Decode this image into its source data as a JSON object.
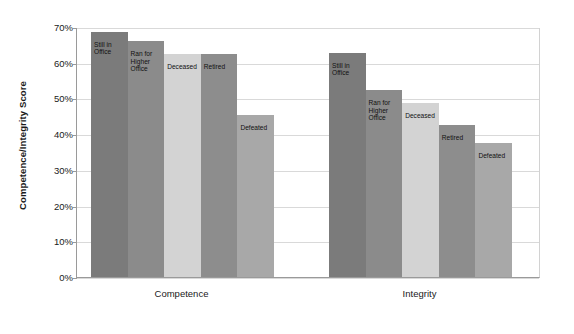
{
  "chart_data": {
    "type": "bar",
    "title": "",
    "xlabel": "",
    "ylabel": "Competence/Integrity Score",
    "ylim": [
      0,
      70
    ],
    "ytick_labels": [
      "0%",
      "10%",
      "20%",
      "30%",
      "40%",
      "50%",
      "60%",
      "70%"
    ],
    "ytick_values": [
      0,
      10,
      20,
      30,
      40,
      50,
      60,
      70
    ],
    "grid": true,
    "legend": "none",
    "categories": [
      "Still in Office",
      "Ran for Higher Office",
      "Deceased",
      "Retired",
      "Defeated"
    ],
    "groups": [
      "Competence",
      "Integrity"
    ],
    "series": [
      {
        "name": "Competence",
        "values": [
          68.7,
          66.0,
          62.5,
          62.4,
          45.3
        ]
      },
      {
        "name": "Integrity",
        "values": [
          62.8,
          52.3,
          48.8,
          42.5,
          37.5
        ]
      }
    ],
    "bar_colors": [
      "#7b7b7b",
      "#8b8b8b",
      "#d3d3d3",
      "#8d8d8d",
      "#a8a8a8"
    ],
    "bar_label_texts": [
      [
        "Still in",
        "Office"
      ],
      [
        "Ran for",
        "Higher",
        "Office"
      ],
      [
        "Deceased"
      ],
      [
        "Retired"
      ],
      [
        "Defeated"
      ]
    ]
  },
  "axis": {
    "y_title": "Competence/Integrity Score",
    "ticks": [
      "70%",
      "60%",
      "50%",
      "40%",
      "30%",
      "20%",
      "10%",
      "0%"
    ],
    "group_competence": "Competence",
    "group_integrity": "Integrity"
  }
}
